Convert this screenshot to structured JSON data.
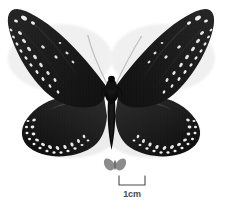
{
  "plate": {
    "background_color": "#ffffff",
    "specimen_common_name": "crow butterfly",
    "view": "dorsal, spread, pinned specimen"
  },
  "specimen": {
    "body_color": "#0a0a0a",
    "wing_color": "#1c1c1c",
    "wing_highlight_color": "#3a3a3a",
    "spot_color": "#f2f2f2",
    "antenna_color": "#b9b9b9",
    "shadow_color": "#d9d9d9",
    "wingspan_label": "",
    "parts": {
      "left_forewing": "left-forewing",
      "right_forewing": "right-forewing",
      "left_hindwing": "left-hindwing",
      "right_hindwing": "right-hindwing",
      "thorax": "thorax",
      "abdomen": "abdomen",
      "left_antenna": "left-antenna",
      "right_antenna": "right-antenna"
    }
  },
  "silhouette_icon": {
    "name": "butterfly-silhouette-icon",
    "color": "#8c8c8c"
  },
  "scale": {
    "label": "1cm",
    "length_px": 26,
    "tick_color": "#4a4a4a",
    "text_color": "#4a4a4a"
  }
}
